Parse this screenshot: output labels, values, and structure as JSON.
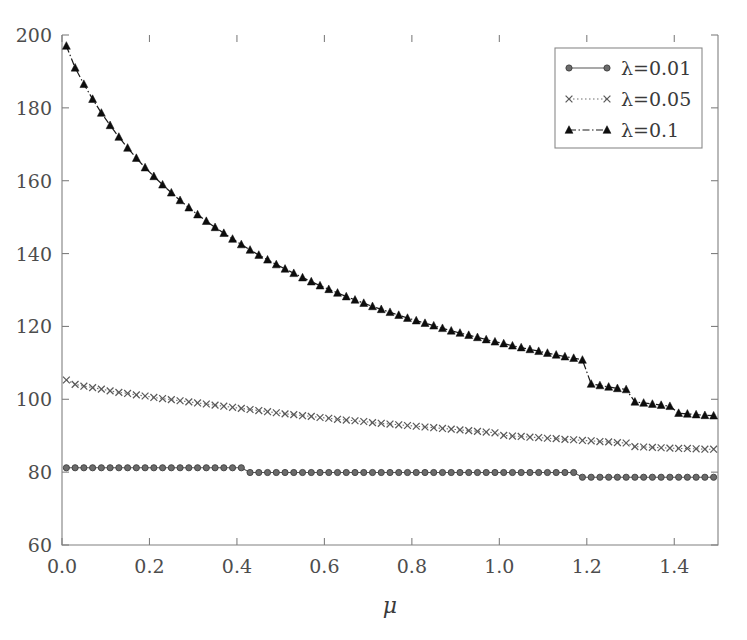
{
  "chart_data": {
    "type": "line",
    "title": "",
    "xlabel": "μ",
    "ylabel": "",
    "xlim": [
      0.0,
      1.5
    ],
    "ylim": [
      60,
      200
    ],
    "xticks": [
      0.0,
      0.2,
      0.4,
      0.6,
      0.8,
      1.0,
      1.2,
      1.4
    ],
    "xtick_labels": [
      "0.0",
      "0.2",
      "0.4",
      "0.6",
      "0.8",
      "1.0",
      "1.2",
      "1.4"
    ],
    "yticks": [
      60,
      80,
      100,
      120,
      140,
      160,
      180,
      200
    ],
    "ytick_labels": [
      "60",
      "80",
      "100",
      "120",
      "140",
      "160",
      "180",
      "200"
    ],
    "grid": false,
    "legend_position": "upper right",
    "legend_entries": [
      "λ=0.01",
      "λ=0.05",
      "λ=0.1"
    ],
    "series": [
      {
        "name": "λ=0.01",
        "marker": "circle",
        "linestyle": "solid",
        "color": "#6b6b6b",
        "x": [
          0.01,
          0.03,
          0.05,
          0.07,
          0.09,
          0.11,
          0.13,
          0.15,
          0.17,
          0.19,
          0.21,
          0.23,
          0.25,
          0.27,
          0.29,
          0.31,
          0.33,
          0.35,
          0.37,
          0.39,
          0.41,
          0.43,
          0.45,
          0.47,
          0.49,
          0.51,
          0.53,
          0.55,
          0.57,
          0.59,
          0.61,
          0.63,
          0.65,
          0.67,
          0.69,
          0.71,
          0.73,
          0.75,
          0.77,
          0.79,
          0.81,
          0.83,
          0.85,
          0.87,
          0.89,
          0.91,
          0.93,
          0.95,
          0.97,
          0.99,
          1.01,
          1.03,
          1.05,
          1.07,
          1.09,
          1.11,
          1.13,
          1.15,
          1.17,
          1.19,
          1.21,
          1.23,
          1.25,
          1.27,
          1.29,
          1.31,
          1.33,
          1.35,
          1.37,
          1.39,
          1.41,
          1.43,
          1.45,
          1.47,
          1.49
        ],
        "y": [
          81.2,
          81.2,
          81.2,
          81.2,
          81.2,
          81.2,
          81.2,
          81.2,
          81.2,
          81.2,
          81.2,
          81.2,
          81.2,
          81.2,
          81.2,
          81.2,
          81.2,
          81.2,
          81.2,
          81.2,
          81.2,
          79.9,
          79.9,
          79.9,
          79.9,
          79.9,
          79.9,
          79.9,
          79.9,
          79.9,
          79.9,
          79.9,
          79.9,
          79.9,
          79.9,
          79.9,
          79.9,
          79.9,
          79.9,
          79.9,
          79.9,
          79.9,
          79.9,
          79.9,
          79.9,
          79.9,
          79.9,
          79.9,
          79.9,
          79.9,
          79.9,
          79.9,
          79.9,
          79.9,
          79.9,
          79.9,
          79.9,
          79.9,
          79.9,
          78.6,
          78.6,
          78.6,
          78.6,
          78.6,
          78.6,
          78.6,
          78.6,
          78.6,
          78.6,
          78.6,
          78.6,
          78.6,
          78.6,
          78.6,
          78.6
        ]
      },
      {
        "name": "λ=0.05",
        "marker": "x",
        "linestyle": "dotted",
        "color": "#5a5a5a",
        "x": [
          0.01,
          0.03,
          0.05,
          0.07,
          0.09,
          0.11,
          0.13,
          0.15,
          0.17,
          0.19,
          0.21,
          0.23,
          0.25,
          0.27,
          0.29,
          0.31,
          0.33,
          0.35,
          0.37,
          0.39,
          0.41,
          0.43,
          0.45,
          0.47,
          0.49,
          0.51,
          0.53,
          0.55,
          0.57,
          0.59,
          0.61,
          0.63,
          0.65,
          0.67,
          0.69,
          0.71,
          0.73,
          0.75,
          0.77,
          0.79,
          0.81,
          0.83,
          0.85,
          0.87,
          0.89,
          0.91,
          0.93,
          0.95,
          0.97,
          0.99,
          1.01,
          1.03,
          1.05,
          1.07,
          1.09,
          1.11,
          1.13,
          1.15,
          1.17,
          1.19,
          1.21,
          1.23,
          1.25,
          1.27,
          1.29,
          1.31,
          1.33,
          1.35,
          1.37,
          1.39,
          1.41,
          1.43,
          1.45,
          1.47,
          1.49
        ],
        "y": [
          105.3,
          104.1,
          103.6,
          103.2,
          102.8,
          102.3,
          101.9,
          101.6,
          101.2,
          100.9,
          100.5,
          100.2,
          99.9,
          99.6,
          99.3,
          99.0,
          98.7,
          98.4,
          98.1,
          97.8,
          97.5,
          97.2,
          96.9,
          96.6,
          96.3,
          96.0,
          95.8,
          95.5,
          95.3,
          95.0,
          94.8,
          94.5,
          94.3,
          94.1,
          93.9,
          93.6,
          93.4,
          93.2,
          93.0,
          92.8,
          92.6,
          92.4,
          92.2,
          92.0,
          91.8,
          91.6,
          91.4,
          91.2,
          91.0,
          90.8,
          90.1,
          89.9,
          89.8,
          89.6,
          89.5,
          89.3,
          89.2,
          89.0,
          88.9,
          88.7,
          88.6,
          88.4,
          88.3,
          88.1,
          88.0,
          87.0,
          86.9,
          86.8,
          86.7,
          86.6,
          86.5,
          86.5,
          86.4,
          86.3,
          86.3
        ]
      },
      {
        "name": "λ=0.1",
        "marker": "triangle",
        "linestyle": "dashdot",
        "color": "#0d0d0d",
        "x": [
          0.01,
          0.03,
          0.05,
          0.07,
          0.09,
          0.11,
          0.13,
          0.15,
          0.17,
          0.19,
          0.21,
          0.23,
          0.25,
          0.27,
          0.29,
          0.31,
          0.33,
          0.35,
          0.37,
          0.39,
          0.41,
          0.43,
          0.45,
          0.47,
          0.49,
          0.51,
          0.53,
          0.55,
          0.57,
          0.59,
          0.61,
          0.63,
          0.65,
          0.67,
          0.69,
          0.71,
          0.73,
          0.75,
          0.77,
          0.79,
          0.81,
          0.83,
          0.85,
          0.87,
          0.89,
          0.91,
          0.93,
          0.95,
          0.97,
          0.99,
          1.01,
          1.03,
          1.05,
          1.07,
          1.09,
          1.11,
          1.13,
          1.15,
          1.17,
          1.19,
          1.21,
          1.23,
          1.25,
          1.27,
          1.29,
          1.31,
          1.33,
          1.35,
          1.37,
          1.39,
          1.41,
          1.43,
          1.45,
          1.47,
          1.49
        ],
        "y": [
          197.0,
          191.0,
          186.5,
          182.4,
          178.6,
          175.2,
          172.0,
          169.0,
          166.2,
          163.6,
          161.2,
          158.9,
          156.7,
          154.6,
          152.6,
          150.7,
          148.9,
          147.2,
          145.6,
          144.0,
          142.5,
          141.0,
          139.6,
          138.3,
          137.0,
          135.8,
          134.6,
          133.4,
          132.3,
          131.2,
          130.2,
          129.2,
          128.2,
          127.3,
          126.4,
          125.5,
          124.7,
          123.9,
          123.1,
          122.3,
          121.6,
          120.9,
          120.2,
          119.5,
          118.8,
          118.2,
          117.6,
          117.0,
          116.4,
          115.8,
          115.3,
          114.7,
          114.2,
          113.7,
          113.2,
          112.7,
          112.2,
          111.7,
          111.3,
          110.8,
          104.2,
          103.8,
          103.4,
          103.0,
          102.7,
          99.3,
          99.0,
          98.7,
          98.4,
          98.1,
          96.2,
          96.0,
          95.8,
          95.6,
          95.5
        ]
      }
    ]
  },
  "axes": {
    "x_label": "μ"
  },
  "legend": {
    "items": [
      {
        "label": "λ=0.01"
      },
      {
        "label": "λ=0.05"
      },
      {
        "label": "λ=0.1"
      }
    ]
  },
  "colors": {
    "series_0": "#6b6b6b",
    "series_1": "#5a5a5a",
    "series_2": "#0d0d0d",
    "axis": "#808080",
    "text": "#3a3a3a",
    "background": "#ffffff"
  }
}
